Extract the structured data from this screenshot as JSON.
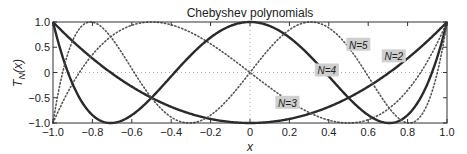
{
  "chart_data": {
    "type": "line",
    "title": "Chebyshev polynomials",
    "xlabel": "x",
    "ylabel": "T_N(x)",
    "xlim": [
      -1.0,
      1.0
    ],
    "ylim": [
      -1.0,
      1.0
    ],
    "xticks": [
      -1.0,
      -0.8,
      -0.6,
      -0.4,
      -0.2,
      0,
      0.2,
      0.4,
      0.6,
      0.8,
      1.0
    ],
    "xtick_labels": [
      "−1.0",
      "−0.8",
      "−0.6",
      "−0.4",
      "−0.2",
      "0",
      "0.2",
      "0.4",
      "0.6",
      "0.8",
      "1.0"
    ],
    "yticks": [
      -1.0,
      -0.5,
      0,
      0.5,
      1.0
    ],
    "ytick_labels": [
      "−1.0",
      "−0.5",
      "0",
      "0.5",
      "1.0"
    ],
    "grid": "dotted lines at x=0 and y=0",
    "legend": "inline labels",
    "series": [
      {
        "name": "N=2",
        "order": 2,
        "style": "solid",
        "color": "#2a2a2a",
        "label_x": 0.73,
        "label_y": 0.32
      },
      {
        "name": "N=3",
        "order": 3,
        "style": "dotted",
        "color": "#555555",
        "label_x": 0.19,
        "label_y": -0.6
      },
      {
        "name": "N=4",
        "order": 4,
        "style": "solid",
        "color": "#2a2a2a",
        "label_x": 0.39,
        "label_y": 0.04
      },
      {
        "name": "N=5",
        "order": 5,
        "style": "dotted",
        "color": "#555555",
        "label_x": 0.55,
        "label_y": 0.55
      }
    ]
  },
  "labels": {
    "title": "Chebyshev polynomials",
    "xlabel": "x",
    "ylabel_main": "T",
    "ylabel_sub": "N",
    "ylabel_arg": "(x)",
    "curve_labels": [
      "N=2",
      "N=3",
      "N=4",
      "N=5"
    ]
  }
}
